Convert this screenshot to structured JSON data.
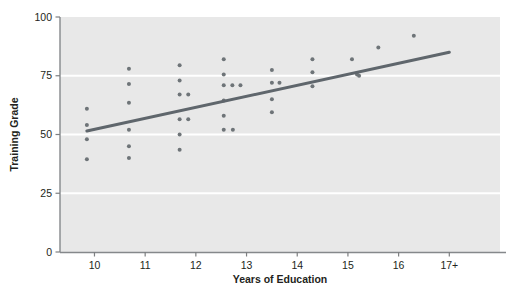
{
  "figure": {
    "background": "#ffffff",
    "plot_background": "#e8e8e8",
    "gridline_color": "#ffffff",
    "axis_color": "#7d7f81",
    "point_color": "#6e7478",
    "trendline_color": "#5f666c",
    "text_color": "#231f20"
  },
  "chart_data": {
    "type": "scatter",
    "title": "",
    "subtitle": "",
    "xlabel": "Years of Education",
    "ylabel": "Training Grade",
    "xlim": [
      9.32,
      18.0
    ],
    "ylim": [
      0,
      100
    ],
    "grid": true,
    "grid_axis": "y",
    "legend": "none",
    "x_tick_values": [
      10,
      11,
      12,
      13,
      14,
      15,
      16,
      17
    ],
    "x_tick_labels": [
      "10",
      "11",
      "12",
      "13",
      "14",
      "15",
      "16",
      "17+"
    ],
    "y_tick_values": [
      0,
      25,
      50,
      75,
      100
    ],
    "y_tick_labels": [
      "0",
      "25",
      "50",
      "75",
      "100"
    ],
    "series": [
      {
        "name": "Observations",
        "marker": "circle",
        "color": "#6e7478",
        "points": [
          [
            9.85,
            61
          ],
          [
            9.85,
            54
          ],
          [
            9.85,
            48
          ],
          [
            9.85,
            39.5
          ],
          [
            10.68,
            78
          ],
          [
            10.68,
            71.5
          ],
          [
            10.68,
            63.5
          ],
          [
            10.68,
            52
          ],
          [
            10.68,
            45
          ],
          [
            10.68,
            40
          ],
          [
            11.68,
            79.5
          ],
          [
            11.68,
            73
          ],
          [
            11.68,
            67
          ],
          [
            11.85,
            67
          ],
          [
            11.68,
            56.5
          ],
          [
            11.85,
            56.5
          ],
          [
            11.68,
            50
          ],
          [
            11.68,
            43.5
          ],
          [
            12.55,
            82
          ],
          [
            12.55,
            75.5
          ],
          [
            12.55,
            71
          ],
          [
            12.72,
            71
          ],
          [
            12.88,
            71
          ],
          [
            12.55,
            64.5
          ],
          [
            12.55,
            58
          ],
          [
            12.55,
            52
          ],
          [
            12.73,
            52
          ],
          [
            13.5,
            77.5
          ],
          [
            13.5,
            72
          ],
          [
            13.65,
            72
          ],
          [
            13.5,
            65
          ],
          [
            13.5,
            59.5
          ],
          [
            14.3,
            82
          ],
          [
            14.3,
            76.5
          ],
          [
            14.3,
            70.5
          ],
          [
            15.08,
            82
          ],
          [
            15.18,
            75.5
          ],
          [
            15.22,
            75
          ],
          [
            15.6,
            87
          ],
          [
            16.3,
            92
          ]
        ]
      }
    ],
    "trendline": {
      "name": "Linear fit",
      "color": "#5f666c",
      "width": 3,
      "x0": 9.85,
      "y0": 51.5,
      "x1": 17.0,
      "y1": 85.0
    }
  }
}
